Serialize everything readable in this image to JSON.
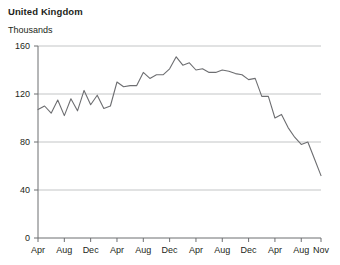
{
  "header": {
    "title": "United Kingdom",
    "subtitle": "Thousands"
  },
  "chart_data": {
    "type": "line",
    "title": "United Kingdom",
    "subtitle": "Thousands",
    "xlabel": "",
    "ylabel": "Thousands",
    "ylim": [
      0,
      160
    ],
    "yticks": [
      0,
      40,
      80,
      120,
      160
    ],
    "grid": true,
    "legend": null,
    "line_color": "#6d6e71",
    "axis_color": "#6d6e71",
    "grid_color": "#bcbec0",
    "xticks": [
      "Apr",
      "Aug",
      "Dec",
      "Apr",
      "Aug",
      "Dec",
      "Apr",
      "Aug",
      "Dec",
      "Apr",
      "Aug",
      "Nov"
    ],
    "x": [
      "Apr",
      "May",
      "Jun",
      "Jul",
      "Aug",
      "Sep",
      "Oct",
      "Nov",
      "Dec",
      "Jan",
      "Feb",
      "Mar",
      "Apr",
      "May",
      "Jun",
      "Jul",
      "Aug",
      "Sep",
      "Oct",
      "Nov",
      "Dec",
      "Jan",
      "Feb",
      "Mar",
      "Apr",
      "May",
      "Jun",
      "Jul",
      "Aug",
      "Sep",
      "Oct",
      "Nov",
      "Dec",
      "Jan",
      "Feb",
      "Mar",
      "Apr",
      "May",
      "Jun",
      "Jul",
      "Aug",
      "Sep",
      "Oct",
      "Nov"
    ],
    "values": [
      107,
      110,
      104,
      115,
      102,
      116,
      106,
      123,
      111,
      119,
      108,
      110,
      130,
      126,
      127,
      127,
      138,
      133,
      136,
      136,
      141,
      151,
      144,
      146,
      140,
      141,
      138,
      138,
      140,
      139,
      137,
      136,
      132,
      133,
      118,
      118,
      100,
      103,
      92,
      84,
      78,
      80,
      66,
      52
    ]
  }
}
